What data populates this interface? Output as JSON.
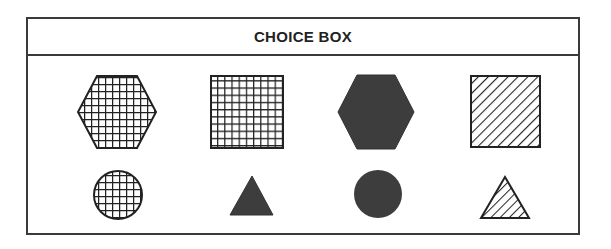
{
  "title": "CHOICE BOX",
  "colors": {
    "border": "#3a3a3a",
    "fill_dark": "#3d3d3d",
    "stroke": "#222222",
    "background": "#ffffff"
  },
  "shapes": [
    {
      "id": "hexagon-grid",
      "shape": "hexagon",
      "fill": "grid"
    },
    {
      "id": "square-grid",
      "shape": "square",
      "fill": "grid"
    },
    {
      "id": "hexagon-solid",
      "shape": "hexagon",
      "fill": "solid-dark"
    },
    {
      "id": "square-hatched",
      "shape": "square",
      "fill": "diagonal-hatch"
    },
    {
      "id": "circle-grid",
      "shape": "circle",
      "fill": "grid"
    },
    {
      "id": "triangle-solid",
      "shape": "triangle",
      "fill": "solid-dark"
    },
    {
      "id": "circle-solid",
      "shape": "circle",
      "fill": "solid-dark"
    },
    {
      "id": "triangle-hatched",
      "shape": "triangle",
      "fill": "diagonal-hatch"
    }
  ]
}
